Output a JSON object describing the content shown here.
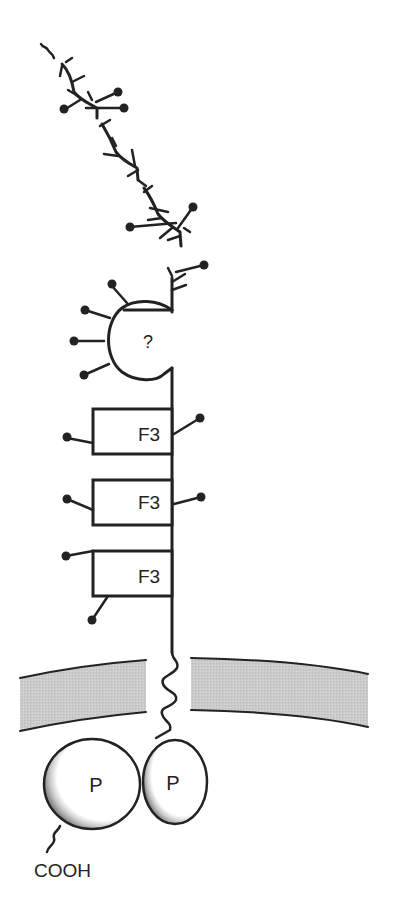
{
  "diagram": {
    "type": "protein-domain-schematic",
    "labels": {
      "unknown_domain": "?",
      "fn3_domain": "F3",
      "phosphatase_domain": "P",
      "c_terminus": "COOH"
    },
    "domains": [
      {
        "name": "unknown-domain",
        "label": "?"
      },
      {
        "name": "fibronectin-type-iii-1",
        "label": "F3"
      },
      {
        "name": "fibronectin-type-iii-2",
        "label": "F3"
      },
      {
        "name": "fibronectin-type-iii-3",
        "label": "F3"
      },
      {
        "name": "phosphatase-domain-1",
        "label": "P"
      },
      {
        "name": "phosphatase-domain-2",
        "label": "P"
      }
    ],
    "colors": {
      "line": "#222222",
      "membrane_fill": "#c8c8c8",
      "domain_fill": "#ffffff",
      "shade": "#9a9a9a"
    }
  }
}
